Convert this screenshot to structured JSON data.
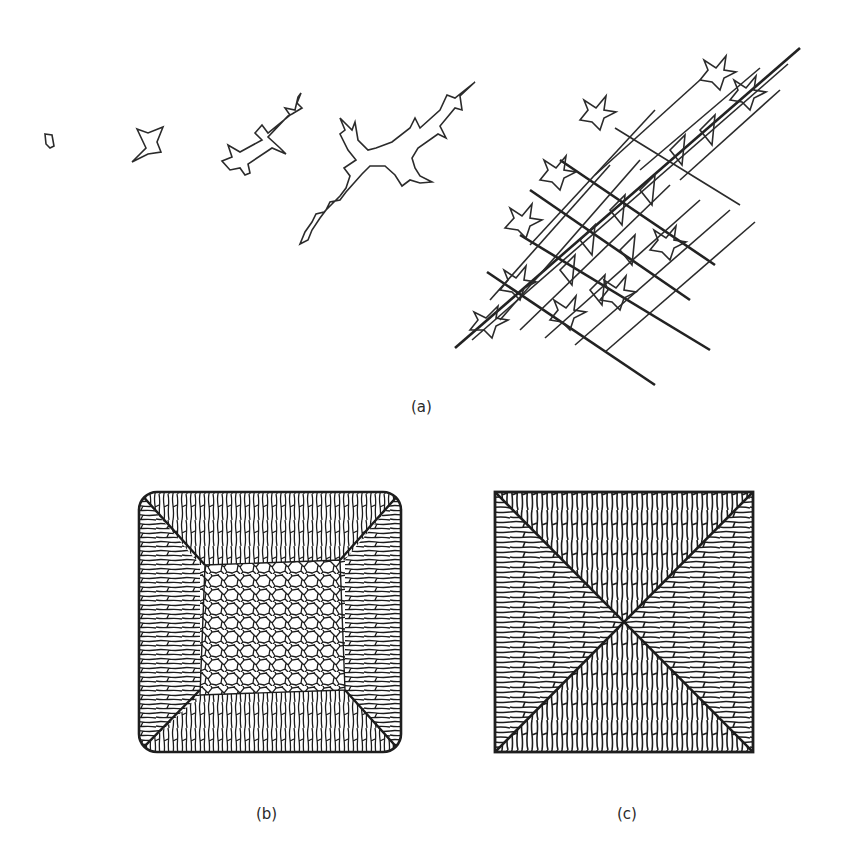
{
  "figure": {
    "panels": [
      {
        "id": "a",
        "label": "(a)",
        "description": "Stages of dendritic crystal growth, from small nucleus to branched dendrite network"
      },
      {
        "id": "b",
        "label": "(b)",
        "description": "Ingot cross-section with rounded corners: columnar grains at edges, equiaxed grains in center"
      },
      {
        "id": "c",
        "label": "(c)",
        "description": "Ingot cross-section with square corners: fully columnar grains meeting along diagonals"
      }
    ]
  },
  "colors": {
    "background": "#ffffff",
    "ink": "#1e1e1e"
  }
}
